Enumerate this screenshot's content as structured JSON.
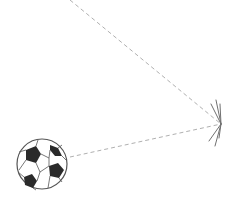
{
  "diagram": {
    "colors": {
      "background": "#ffffff",
      "trajectory": "#b0b0b0",
      "impact": "#707070",
      "ball_outline": "#555555",
      "ball_patch": "#2a2a2a"
    },
    "ball": {
      "cx": 42,
      "cy": 164,
      "r": 25
    },
    "impact_point": {
      "x": 221,
      "y": 124
    },
    "trajectory": [
      {
        "name": "incoming",
        "x1": 70,
        "y1": 0,
        "x2": 221,
        "y2": 124
      },
      {
        "name": "outgoing",
        "x1": 70,
        "y1": 157,
        "x2": 221,
        "y2": 124
      }
    ]
  }
}
